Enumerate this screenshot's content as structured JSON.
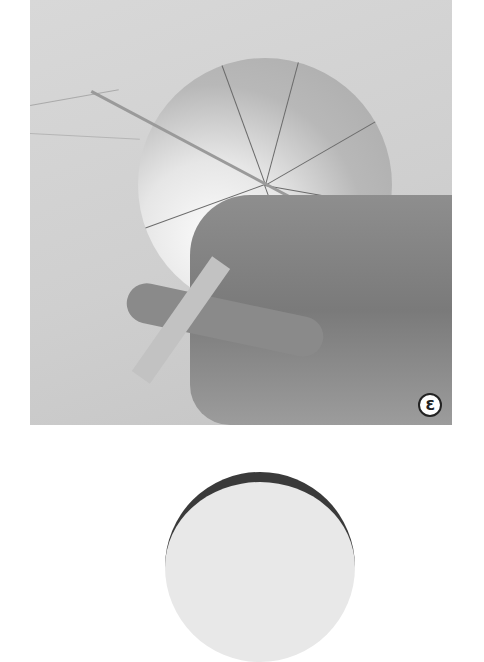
{
  "figure": {
    "step_label": "3",
    "colors": {
      "background": "#ffffff",
      "photo_bg": "#d4d4d4",
      "label_border": "#222222"
    }
  },
  "next_figure": {
    "description": "Top edge of a second ball photo"
  }
}
